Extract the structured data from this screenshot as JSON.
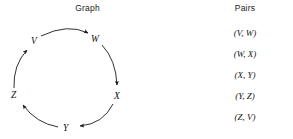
{
  "graph": {
    "title": "Graph",
    "nodes": [
      {
        "id": "V",
        "label": "V",
        "x": 33,
        "y": 42
      },
      {
        "id": "W",
        "label": "W",
        "x": 93,
        "y": 40
      },
      {
        "id": "X",
        "label": "X",
        "x": 116,
        "y": 97
      },
      {
        "id": "Y",
        "label": "Y",
        "x": 65,
        "y": 129
      },
      {
        "id": "Z",
        "label": "Z",
        "x": 13,
        "y": 96
      }
    ],
    "edges": [
      {
        "from": "V",
        "to": "W"
      },
      {
        "from": "W",
        "to": "X"
      },
      {
        "from": "X",
        "to": "Y"
      },
      {
        "from": "Y",
        "to": "Z"
      },
      {
        "from": "Z",
        "to": "V"
      }
    ],
    "edge_color": "#1a1a1a",
    "directed": true
  },
  "pairs": {
    "title": "Pairs",
    "items": [
      "(V, W)",
      "(W, X)",
      "(X, Y)",
      "(Y, Z)",
      "(Z, V)"
    ]
  },
  "colors": {
    "background": "#ffffff",
    "text": "#111111",
    "stroke": "#1a1a1a"
  }
}
